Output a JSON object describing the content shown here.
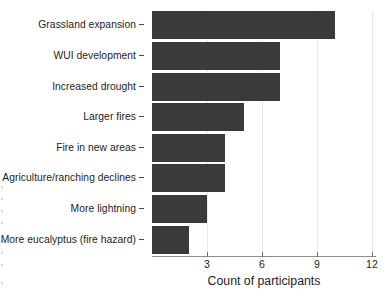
{
  "chart_data": {
    "type": "bar",
    "orientation": "horizontal",
    "title": "",
    "xlabel": "Count of participants",
    "ylabel": "",
    "categories": [
      "Grassland expansion",
      "WUI development",
      "Increased drought",
      "Larger fires",
      "Fire in new areas",
      "Agriculture/ranching declines",
      "More lightning",
      "More eucalyptus (fire hazard)"
    ],
    "values": [
      10,
      7,
      7,
      5,
      4,
      4,
      3,
      2
    ],
    "xlim": [
      0,
      12.2
    ],
    "xticks": [
      3,
      6,
      9,
      12
    ],
    "xtick_labels": [
      "3",
      "6",
      "9",
      "12"
    ],
    "grid": true,
    "grid_axis": "x",
    "legend": false,
    "bar_color": "#3a3a3a",
    "gridline_color": "#e8e8e8",
    "axis_color": "#8f8f8f"
  }
}
